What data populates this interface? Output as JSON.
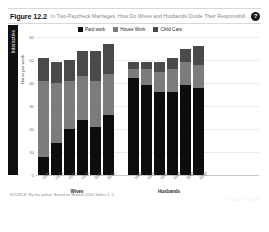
{
  "header": {
    "figure_number": "Figure 12.2",
    "title": "In Two-Paycheck Marriages, How Do Wives and Husbands Divide Their Responsibilities?",
    "help_icon": "question-mark-icon",
    "help_label": "?"
  },
  "side_tab": {
    "label": "Interactive"
  },
  "source_note": "SOURCE: By the author. Based on Bianchi 2010 Tables 1, 2.",
  "watermark": "Visual Figure",
  "colors": {
    "paid_work": "#0d0d0d",
    "house_work": "#7c7c7c",
    "child_care": "#4a4a4a",
    "gridline": "#ececec",
    "tab_background": "#101010"
  },
  "chart_data": {
    "type": "bar",
    "stacked": true,
    "title": "In Two-Paycheck Marriages, How Do Wives and Husbands Divide Their Responsibilities?",
    "xlabel": "",
    "ylabel": "Hours per week",
    "ylim": [
      0,
      60
    ],
    "yticks": [
      0,
      10,
      20,
      30,
      40,
      50,
      60
    ],
    "grid": true,
    "legend_position": "top",
    "legend": [
      "Paid work",
      "House Work",
      "Child Care"
    ],
    "groups": [
      {
        "name": "Wives",
        "categories": [
          "1965",
          "1975",
          "1985",
          "1995",
          "2000",
          "2010"
        ],
        "series": [
          {
            "name": "Paid work",
            "values": [
              8,
              14,
              20,
              24,
              21,
              26
            ]
          },
          {
            "name": "House Work",
            "values": [
              33,
              26,
              21,
              19,
              20,
              18
            ]
          },
          {
            "name": "Child Care",
            "values": [
              10,
              9,
              9,
              11,
              13,
              13
            ]
          }
        ],
        "totals": [
          51,
          49,
          50,
          54,
          54,
          57
        ]
      },
      {
        "name": "Husbands",
        "categories": [
          "1965",
          "1975",
          "1985",
          "1995",
          "2000",
          "2010"
        ],
        "series": [
          {
            "name": "Paid work",
            "values": [
              42,
              39,
              36,
              36,
              39,
              38
            ]
          },
          {
            "name": "House Work",
            "values": [
              4,
              7,
              9,
              10,
              10,
              10
            ]
          },
          {
            "name": "Child Care",
            "values": [
              3,
              3,
              4,
              5,
              6,
              8
            ]
          }
        ],
        "totals": [
          49,
          49,
          49,
          51,
          55,
          56
        ]
      }
    ]
  }
}
